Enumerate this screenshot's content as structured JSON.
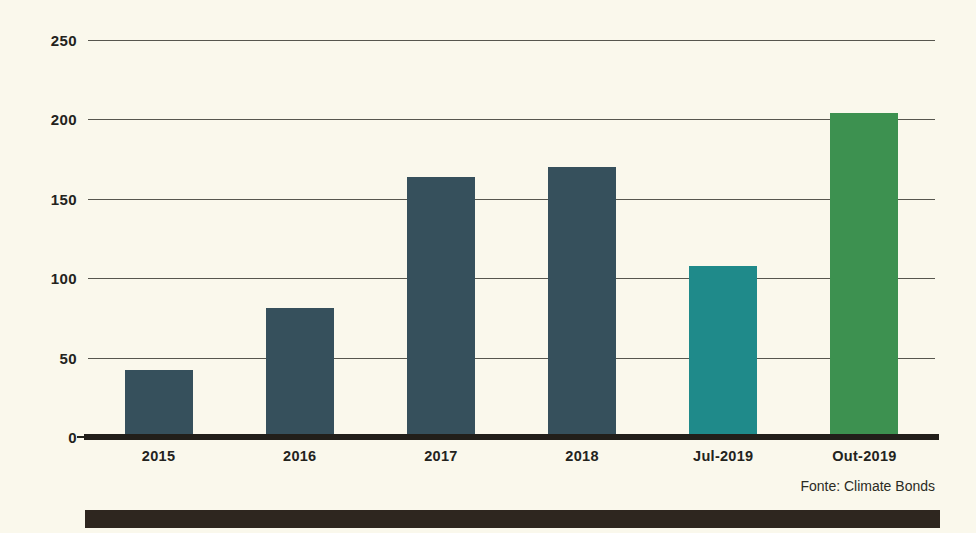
{
  "chart_data": {
    "type": "bar",
    "title": "",
    "subtitle": "",
    "xlabel": "",
    "ylabel": "",
    "categories": [
      "2015",
      "2016",
      "2017",
      "2018",
      "Jul-2019",
      "Out-2019"
    ],
    "values": [
      42,
      81,
      164,
      170,
      108,
      204
    ],
    "bar_colors": [
      "#36505c",
      "#36505c",
      "#36505c",
      "#36505c",
      "#1f8a8a",
      "#3d9150"
    ],
    "ylim": [
      0,
      250
    ],
    "yticks": [
      0,
      50,
      100,
      150,
      200,
      250
    ],
    "ytick_labels": [
      "0",
      "50",
      "100",
      "150",
      "200",
      "250"
    ],
    "grid": true,
    "legend": "none",
    "annotations": [
      "Fonte: Climate Bonds"
    ],
    "source_note": "Fonte: Climate Bonds"
  },
  "figure": {
    "background_color": "#faf8ec",
    "axis_color": "#221f1a",
    "grid_color": "#3a3a32",
    "text_color": "#23231d",
    "decorative_bar_color": "#2e261f"
  }
}
